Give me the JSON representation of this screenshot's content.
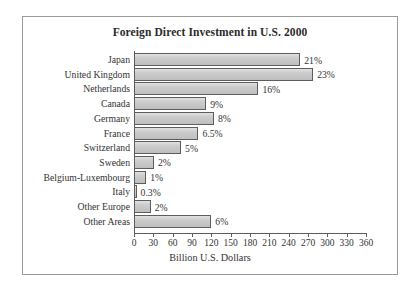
{
  "chart_data": {
    "type": "bar",
    "orientation": "horizontal",
    "title": "Foreign Direct Investment in U.S. 2000",
    "xlabel": "Billion U.S. Dollars",
    "ylabel": "",
    "xlim": [
      0,
      360
    ],
    "xticks": [
      0,
      30,
      60,
      90,
      120,
      150,
      180,
      210,
      240,
      270,
      300,
      330,
      360
    ],
    "grid": false,
    "legend": null,
    "value_unit": "Billion U.S. Dollars",
    "categories": [
      "Japan",
      "United Kingdom",
      "Netherlands",
      "Canada",
      "Germany",
      "France",
      "Switzerland",
      "Sweden",
      "Belgium-Luxembourg",
      "Italy",
      "Other Europe",
      "Other Areas"
    ],
    "values": [
      258,
      278,
      193,
      112,
      124,
      100,
      73,
      31,
      19,
      4,
      26,
      120
    ],
    "data_labels": [
      "21%",
      "23%",
      "16%",
      "9%",
      "8%",
      "6.5%",
      "5%",
      "2%",
      "1%",
      "0.3%",
      "2%",
      "6%"
    ],
    "series": [
      {
        "name": "Foreign Direct Investment",
        "values": [
          258,
          278,
          193,
          112,
          124,
          100,
          73,
          31,
          19,
          4,
          26,
          120
        ]
      }
    ]
  },
  "style": {
    "bar_fill": "#c9c9c9",
    "bar_stroke": "#5d5d5d",
    "axis_color": "#5d5d5d",
    "frame_color": "#9a9a9a",
    "text_color": "#333333",
    "background": "#ffffff"
  }
}
